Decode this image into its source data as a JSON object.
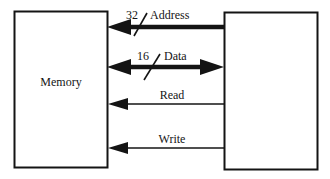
{
  "diagram": {
    "background_color": "#ffffff",
    "line_color": "#141414",
    "blocks": [
      {
        "id": "memory",
        "label": "Memory",
        "x": 14,
        "y": 11,
        "width": 93,
        "height": 156
      },
      {
        "id": "processor",
        "label": "",
        "x": 224,
        "y": 12,
        "width": 93,
        "height": 157
      }
    ],
    "signals": [
      {
        "id": "address",
        "label": "Address",
        "width_label": "32",
        "slash": true,
        "direction": "right-to-left",
        "thickness": "bus",
        "y": 27,
        "x_start": 224,
        "x_end": 108
      },
      {
        "id": "data",
        "label": "Data",
        "width_label": "16",
        "slash": true,
        "direction": "bidirectional",
        "thickness": "bus",
        "y": 67,
        "x_start": 224,
        "x_end": 108
      },
      {
        "id": "read",
        "label": "Read",
        "width_label": "",
        "slash": false,
        "direction": "right-to-left",
        "thickness": "wire",
        "y": 104,
        "x_start": 224,
        "x_end": 108
      },
      {
        "id": "write",
        "label": "Write",
        "width_label": "",
        "slash": false,
        "direction": "right-to-left",
        "thickness": "wire",
        "y": 148,
        "x_start": 224,
        "x_end": 108
      }
    ]
  }
}
